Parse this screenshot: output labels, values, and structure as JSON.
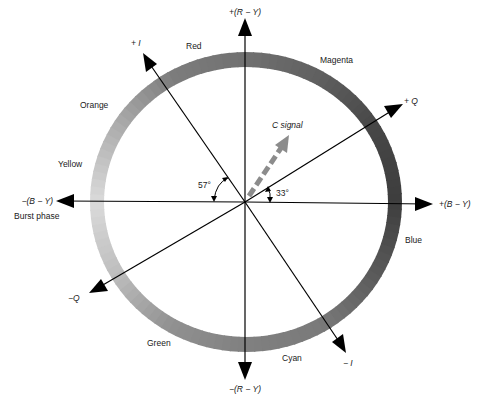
{
  "diagram": {
    "axes": {
      "plus_r_y": "+(R − Y)",
      "minus_r_y": "−(R − Y)",
      "plus_b_y": "+(B − Y)",
      "minus_b_y": "−(B − Y)",
      "plus_i": "+ I",
      "minus_i": "− I",
      "plus_q": "+ Q",
      "minus_q": "−Q"
    },
    "burst_phase_label": "Burst phase",
    "c_signal_label": "C signal",
    "angles": {
      "i_angle": "57°",
      "q_angle": "33°",
      "i_angle_degrees": 57,
      "q_angle_degrees": 33
    },
    "hues": [
      {
        "name": "Red",
        "shade": "#6e6e6e"
      },
      {
        "name": "Magenta",
        "shade": "#5a5a5a"
      },
      {
        "name": "Blue",
        "shade": "#3e3e3e"
      },
      {
        "name": "Cyan",
        "shade": "#7a7a7a"
      },
      {
        "name": "Green",
        "shade": "#858585"
      },
      {
        "name": "Yellow",
        "shade": "#dadada"
      },
      {
        "name": "Orange",
        "shade": "#9a9a9a"
      }
    ]
  }
}
